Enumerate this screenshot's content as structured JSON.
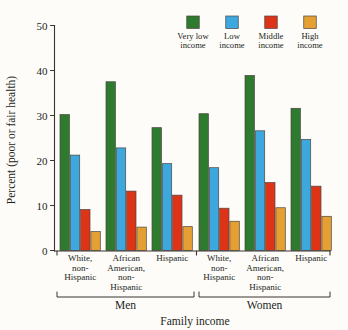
{
  "chart_data": {
    "type": "bar",
    "title": "",
    "xlabel": "Family income",
    "ylabel": "Percent (poor or fair health)",
    "ylim": [
      0,
      50
    ],
    "yticks": [
      0,
      10,
      20,
      30,
      40,
      50
    ],
    "ytick_labels": [
      "0",
      "10",
      "20",
      "30",
      "40",
      "50"
    ],
    "grid": false,
    "legend_position": "top-right",
    "categories": [
      "White, non-Hispanic",
      "African American, non-Hispanic",
      "Hispanic",
      "White, non-Hispanic",
      "African American, non-Hispanic",
      "Hispanic"
    ],
    "category_lines": [
      [
        "White,",
        "non-",
        "Hispanic"
      ],
      [
        "African",
        "American,",
        "non-",
        "Hispanic"
      ],
      [
        "Hispanic"
      ],
      [
        "White,",
        "non-",
        "Hispanic"
      ],
      [
        "African",
        "American,",
        "non-",
        "Hispanic"
      ],
      [
        "Hispanic"
      ]
    ],
    "supergroups": [
      {
        "label": "Men",
        "categories": [
          0,
          1,
          2
        ]
      },
      {
        "label": "Women",
        "categories": [
          3,
          4,
          5
        ]
      }
    ],
    "series": [
      {
        "name": "Very low income",
        "name_lines": [
          "Very low",
          "income"
        ],
        "color": "#2e7a2f",
        "values": [
          30.2,
          37.5,
          27.3,
          30.4,
          38.9,
          31.6
        ]
      },
      {
        "name": "Low income",
        "name_lines": [
          "Low",
          "income"
        ],
        "color": "#3da8dd",
        "values": [
          21.2,
          22.8,
          19.3,
          18.4,
          26.6,
          24.7
        ]
      },
      {
        "name": "Middle income",
        "name_lines": [
          "Middle",
          "income"
        ],
        "color": "#dd3418",
        "values": [
          9.1,
          13.2,
          12.3,
          9.4,
          15.1,
          14.3
        ]
      },
      {
        "name": "High income",
        "name_lines": [
          "High",
          "income"
        ],
        "color": "#e4a033",
        "values": [
          4.2,
          5.2,
          5.3,
          6.5,
          9.5,
          7.6
        ]
      }
    ]
  },
  "legend": {
    "items": [
      {
        "label_line1": "Very low",
        "label_line2": "income",
        "color": "#2e7a2f"
      },
      {
        "label_line1": "Low",
        "label_line2": "income",
        "color": "#3da8dd"
      },
      {
        "label_line1": "Middle",
        "label_line2": "income",
        "color": "#dd3418"
      },
      {
        "label_line1": "High",
        "label_line2": "income",
        "color": "#e4a033"
      }
    ]
  },
  "axes": {
    "y_title": "Percent (poor or fair health)",
    "x_title": "Family income"
  }
}
